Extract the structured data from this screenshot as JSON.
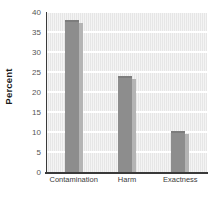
{
  "chart_data": {
    "type": "bar",
    "title": "",
    "subtitle": "",
    "xlabel": "",
    "ylabel": "Percent",
    "categories": [
      "Contamination",
      "Harm",
      "Exactness"
    ],
    "values": [
      38,
      24,
      10.3
    ],
    "ylim": [
      0,
      40
    ],
    "yticks": [
      0,
      5,
      10,
      15,
      20,
      25,
      30,
      35,
      40
    ],
    "ytick_labels": [
      "0",
      "5",
      "10",
      "15",
      "20",
      "25",
      "30",
      "35",
      "40"
    ],
    "grid": true,
    "grid_orientation": "horizontal",
    "legend": false,
    "legend_position": "none",
    "series": [
      {
        "name": "Percent",
        "values": [
          38,
          24,
          10.3
        ]
      }
    ],
    "annotations": []
  },
  "style": {
    "plot_background": "#e6e6e6",
    "gridline_color": "#ffffff",
    "bar_color": "#8d8d8d",
    "bar_shadow_color": "#b4b4b4",
    "axis_color": "#3a3a3a",
    "tick_label_color": "#555555",
    "axis_title_color": "#1a1a1a",
    "page_background": "#ffffff"
  }
}
